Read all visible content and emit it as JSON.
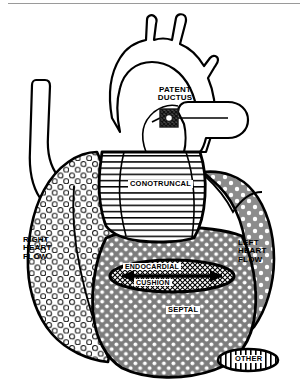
{
  "figure": {
    "name": "cardiac-malformation-categories-diagram",
    "background_color": "#ffffff",
    "outline_color": "#000000"
  },
  "labels": {
    "patent_ductus": "PATENT\nDUCTUS",
    "conotruncal": "CONOTRUNCAL",
    "right_heart_flow": "RIGHT\nHEART\nFLOW",
    "left_heart_flow": "LEFT\nHEART\nFLOW",
    "endocardial": "ENDOCARDIAL",
    "cushion": "CUSHION",
    "septal": "SEPTAL",
    "other": "OTHER"
  },
  "regions": [
    {
      "id": "right-heart-flow",
      "label": "RIGHT\nHEART\nFLOW",
      "fill_color": "#ffffff",
      "pattern": "open-circles",
      "pattern_stroke": "#1a1a1a"
    },
    {
      "id": "conotruncal",
      "label": "CONOTRUNCAL",
      "fill_color": "#ffffff",
      "pattern": "horizontal-lines",
      "pattern_stroke": "#000000"
    },
    {
      "id": "septal",
      "label": "SEPTAL",
      "fill_color": "#808080",
      "pattern": "white-dots-dense",
      "pattern_dot": "#ffffff"
    },
    {
      "id": "left-heart-flow",
      "label": "LEFT\nHEART\nFLOW",
      "fill_color": "#8c8c8c",
      "pattern": "white-dots-sparse",
      "pattern_dot": "#ffffff"
    },
    {
      "id": "endocardial-cushion",
      "label": "ENDOCARDIAL CUSHION",
      "fill_color": "#ffffff",
      "pattern": "cross-hatch",
      "pattern_stroke": "#000000"
    },
    {
      "id": "other",
      "label": "OTHER",
      "fill_color": "#ffffff",
      "pattern": "vertical-lines",
      "pattern_stroke": "#000000"
    },
    {
      "id": "patent-ductus-marker",
      "label": "PATENT DUCTUS",
      "fill_color": "#3a3a3a",
      "pattern": "dark-crosshatch"
    }
  ],
  "vessels": {
    "aortic_arch": "unfilled",
    "branch_count": 3,
    "superior_vena_cava": "unfilled",
    "pulmonary_artery": "unfilled"
  }
}
